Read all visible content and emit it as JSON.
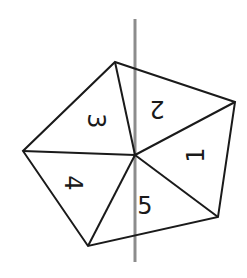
{
  "diagram": {
    "type": "pentagon divided into 5 triangles with a symmetry/rotation axis",
    "colors": {
      "edges": "#1a1a1a",
      "axis": "#8c8c8c",
      "background": "#ffffff"
    },
    "axis": {
      "x": 135,
      "y1": 19,
      "y2": 262
    },
    "center": [
      135,
      155
    ],
    "vertices": [
      [
        115,
        62
      ],
      [
        235,
        102
      ],
      [
        218,
        217
      ],
      [
        88,
        246
      ],
      [
        23,
        151
      ]
    ],
    "sections": [
      {
        "label": "3",
        "x": 96,
        "y": 121,
        "rotate": 90
      },
      {
        "label": "2",
        "x": 157,
        "y": 109,
        "rotate": 180
      },
      {
        "label": "1",
        "x": 196,
        "y": 155,
        "rotate": -90
      },
      {
        "label": "4",
        "x": 73,
        "y": 183,
        "rotate": 90
      },
      {
        "label": "5",
        "x": 145,
        "y": 206,
        "rotate": 0
      }
    ]
  }
}
